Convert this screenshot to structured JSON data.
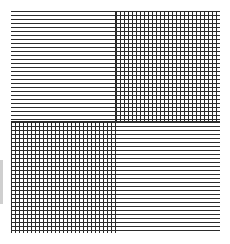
{
  "figure": {
    "background_color": "#ffffff",
    "line_color": "#2b2b2b",
    "line_width_px": 1,
    "line_pitch_px": 4,
    "rows": 2,
    "columns": 2
  },
  "swatches": [
    {
      "position": "top-left",
      "pattern": "horizontal-lines",
      "orientation": "horizontal",
      "line_color": "#2b2b2b",
      "pitch_px": 4,
      "label": ""
    },
    {
      "position": "top-right",
      "pattern": "crosshatch",
      "orientation": "horizontal-and-vertical",
      "line_color": "#2b2b2b",
      "pitch_px": 4,
      "label": ""
    },
    {
      "position": "bottom-left",
      "pattern": "crosshatch",
      "orientation": "horizontal-and-vertical",
      "line_color": "#2b2b2b",
      "pitch_px": 4,
      "label": ""
    },
    {
      "position": "bottom-right",
      "pattern": "horizontal-lines",
      "orientation": "horizontal",
      "line_color": "#2b2b2b",
      "pitch_px": 4,
      "label": ""
    }
  ]
}
